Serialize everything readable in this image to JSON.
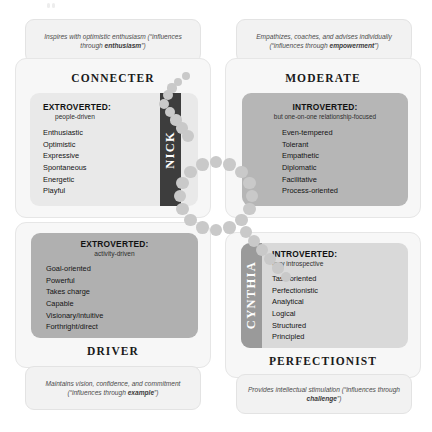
{
  "diagram": {
    "type": "2x2-quadrant-grid",
    "colors": {
      "card_bg": "#f7f7f7",
      "caption_bg": "#f2f2f2",
      "panel_light": "#e9e9e9",
      "panel_mid": "#b6b6b6",
      "panel_mid2": "#b0b0b0",
      "panel_light2": "#d9d9d9",
      "strip_dark": "#3d3d3d",
      "strip_mid": "#9a9a9a",
      "dot": "#c9c9c9",
      "text_dark": "#111111"
    }
  },
  "quadrants": {
    "connecter": {
      "title": "CONNECTER",
      "caption_lead": "Inspires with optimistic enthusiasm (“influences through ",
      "caption_bold": "enthusiasm",
      "caption_tail": "”)",
      "orientation": "EXTROVERTED:",
      "orientation_detail": "people-driven",
      "traits": [
        "Enthusiastic",
        "Optimistic",
        "Expressive",
        "Spontaneous",
        "Energetic",
        "Playful"
      ]
    },
    "moderate": {
      "title": "MODERATE",
      "caption_lead": "Empathizes, coaches, and advises individually (“influences through ",
      "caption_bold": "empowerment",
      "caption_tail": "”)",
      "orientation": "INTROVERTED:",
      "orientation_detail": "but one-on-one relationship-focused",
      "traits": [
        "Even-tempered",
        "Tolerant",
        "Empathetic",
        "Diplomatic",
        "Facilitative",
        "Process-oriented"
      ]
    },
    "driver": {
      "title": "DRIVER",
      "caption_lead": "Maintains vision, confidence, and commitment (“influences through ",
      "caption_bold": "example",
      "caption_tail": "”)",
      "orientation": "EXTROVERTED:",
      "orientation_detail": "activity-driven",
      "traits": [
        "Goal-oriented",
        "Powerful",
        "Takes charge",
        "Capable",
        "Visionary/intuitive",
        "Forthright/direct"
      ]
    },
    "perfectionist": {
      "title": "PERFECTIONIST",
      "caption_lead": "Provides intellectual stimulation (“influences through ",
      "caption_bold": "challenge",
      "caption_tail": "”)",
      "orientation": "INTROVERTED:",
      "orientation_detail": "very introspective",
      "traits": [
        "Task-oriented",
        "Perfectionistic",
        "Analytical",
        "Logical",
        "Structured",
        "Principled"
      ]
    }
  },
  "markers": [
    {
      "name": "NICK",
      "quadrant": "connecter"
    },
    {
      "name": "CYNTHIA",
      "quadrant": "perfectionist"
    }
  ]
}
